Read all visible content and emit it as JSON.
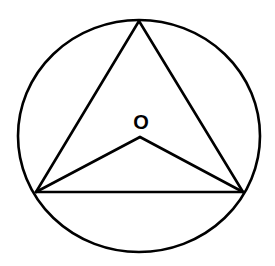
{
  "diagram": {
    "type": "geometry",
    "colors": {
      "stroke": "#000000",
      "background": "#ffffff"
    },
    "circle": {
      "cx": 139,
      "cy": 136,
      "rx": 121,
      "ry": 116
    },
    "center": {
      "label": "O",
      "x": 140,
      "y": 137,
      "label_x": 141,
      "label_y": 129
    },
    "vertices": {
      "top": {
        "x": 139,
        "y": 21
      },
      "left": {
        "x": 36,
        "y": 192
      },
      "right": {
        "x": 243,
        "y": 192
      }
    },
    "segments": [
      {
        "name": "top-left",
        "from": "top",
        "to": "left"
      },
      {
        "name": "top-right",
        "from": "top",
        "to": "right"
      },
      {
        "name": "left-right",
        "from": "left",
        "to": "right"
      },
      {
        "name": "O-left",
        "from": "center",
        "to": "left"
      },
      {
        "name": "O-right",
        "from": "center",
        "to": "right"
      }
    ]
  }
}
